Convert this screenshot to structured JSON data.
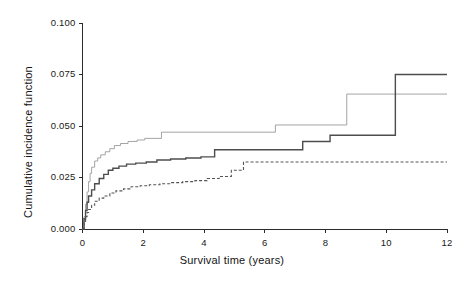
{
  "chart_data": {
    "type": "line",
    "title": "",
    "xlabel": "Survival time (years)",
    "ylabel": "Cumulative incidence function",
    "xlim": [
      0,
      12
    ],
    "ylim": [
      0.0,
      0.1
    ],
    "grid": false,
    "legend_position": "none",
    "xticks": [
      "0",
      "2",
      "4",
      "6",
      "8",
      "10",
      "12"
    ],
    "xtick_values": [
      0,
      2,
      4,
      6,
      8,
      10,
      12
    ],
    "yticks": [
      "0.000",
      "0.025",
      "0.050",
      "0.075",
      "0.100"
    ],
    "ytick_values": [
      0.0,
      0.025,
      0.05,
      0.075,
      0.1
    ],
    "step_type": "post",
    "series": [
      {
        "name": "series-upper-light",
        "style": "solid-thin-light",
        "color": "#9a9a9a",
        "width": 0.9,
        "x": [
          0.0,
          0.05,
          0.1,
          0.15,
          0.2,
          0.25,
          0.3,
          0.4,
          0.5,
          0.6,
          0.75,
          0.9,
          1.05,
          1.25,
          1.5,
          1.8,
          2.05,
          2.6,
          4.2,
          6.35,
          8.7,
          12.0
        ],
        "values": [
          0.0,
          0.006,
          0.012,
          0.018,
          0.023,
          0.027,
          0.03,
          0.033,
          0.0345,
          0.036,
          0.0375,
          0.039,
          0.0405,
          0.0415,
          0.0425,
          0.0432,
          0.044,
          0.047,
          0.047,
          0.0505,
          0.0655,
          0.0655
        ]
      },
      {
        "name": "series-middle-solid",
        "style": "solid",
        "color": "#4d4d4d",
        "width": 1.4,
        "x": [
          0.0,
          0.05,
          0.1,
          0.15,
          0.2,
          0.3,
          0.4,
          0.55,
          0.7,
          0.85,
          1.0,
          1.2,
          1.45,
          1.75,
          2.1,
          2.45,
          2.9,
          3.4,
          3.9,
          4.35,
          5.1,
          6.4,
          7.25,
          8.15,
          10.3,
          12.0
        ],
        "values": [
          0.0,
          0.005,
          0.009,
          0.013,
          0.016,
          0.019,
          0.022,
          0.0245,
          0.0265,
          0.0285,
          0.0295,
          0.0305,
          0.0315,
          0.032,
          0.0325,
          0.0335,
          0.034,
          0.0345,
          0.035,
          0.0385,
          0.0385,
          0.0385,
          0.0425,
          0.0455,
          0.075,
          0.075
        ]
      },
      {
        "name": "series-lower-dashed",
        "style": "dashed",
        "color": "#555555",
        "width": 1.1,
        "x": [
          0.0,
          0.05,
          0.1,
          0.15,
          0.2,
          0.3,
          0.4,
          0.55,
          0.7,
          0.9,
          1.1,
          1.35,
          1.6,
          1.9,
          2.2,
          2.55,
          2.9,
          3.3,
          3.7,
          4.1,
          4.5,
          4.9,
          5.3,
          12.0
        ],
        "values": [
          0.0,
          0.003,
          0.006,
          0.008,
          0.0095,
          0.0115,
          0.0135,
          0.015,
          0.016,
          0.0175,
          0.0185,
          0.0195,
          0.0205,
          0.021,
          0.0215,
          0.022,
          0.0225,
          0.023,
          0.0235,
          0.0245,
          0.0255,
          0.0285,
          0.0325,
          0.0325
        ]
      }
    ]
  },
  "axes": {
    "x_title": "Survival time (years)",
    "y_title": "Cumulative incidence function"
  }
}
